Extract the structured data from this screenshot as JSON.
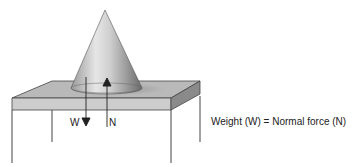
{
  "diagram": {
    "forces": {
      "weight_label": "W",
      "normal_label": "N"
    },
    "caption": "Weight (W) = Normal force (N)",
    "colors": {
      "table_top": "#b9b9b9",
      "table_front": "#c8c8c8",
      "table_side": "#8a8a8a",
      "lines": "#333333"
    }
  }
}
